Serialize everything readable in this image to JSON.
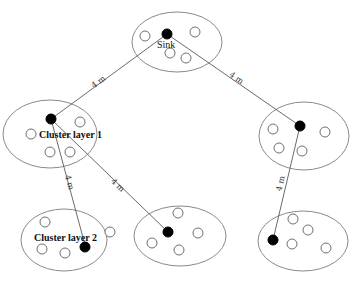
{
  "diagram": {
    "title": "",
    "colors": {
      "cluster_stroke": "#8a8a8a",
      "link": "#6a6a6a",
      "head_node": "#000000",
      "member_node": "#ffffff"
    },
    "clusters": [
      {
        "id": "sink",
        "label": "Sink",
        "label_style": "normal"
      },
      {
        "id": "cluster-layer-1",
        "label": "Cluster layer 1",
        "label_style": "bold"
      },
      {
        "id": "right-middle",
        "label": ""
      },
      {
        "id": "cluster-layer-2",
        "label": "Cluster layer 2",
        "label_style": "bold"
      },
      {
        "id": "bottom-middle",
        "label": ""
      },
      {
        "id": "bottom-right",
        "label": ""
      }
    ],
    "links": [
      {
        "from": "sink",
        "to": "cluster-layer-1",
        "distance": "4 m"
      },
      {
        "from": "sink",
        "to": "right-middle",
        "distance": "4 m"
      },
      {
        "from": "cluster-layer-1",
        "to": "cluster-layer-2",
        "distance": "4 m"
      },
      {
        "from": "cluster-layer-1",
        "to": "bottom-middle",
        "distance": "4 m"
      },
      {
        "from": "right-middle",
        "to": "bottom-right",
        "distance": "4 m"
      }
    ]
  }
}
